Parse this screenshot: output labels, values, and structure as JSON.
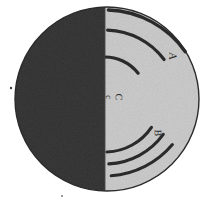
{
  "figure": {
    "type": "scanned-halftone-diagram",
    "caption": "",
    "background_color": "#ffffff"
  },
  "sphere": {
    "center_x": 107,
    "center_y": 99,
    "radius": 92,
    "outline_color": "#2b2b2b",
    "outline_width": 1.4,
    "dark_half": {
      "name": "shadowed-hemisphere",
      "side": "left",
      "fill_color": "#3a3a3a",
      "noise": "heavy"
    },
    "light_half": {
      "name": "illuminated-hemisphere",
      "side": "right",
      "fill_color": "#cdcdcd",
      "noise": "light"
    },
    "terminator": {
      "name": "terminator-line",
      "x": 105,
      "color": "#4a4a4a"
    }
  },
  "labels": [
    {
      "id": "A",
      "text": "A",
      "x": 172,
      "y": 56,
      "rotation": 92,
      "color": "#262626",
      "size": 11
    },
    {
      "id": "C",
      "text": "C",
      "x": 118,
      "y": 97,
      "rotation": 92,
      "color": "#262626",
      "size": 10
    },
    {
      "id": "C2",
      "text": "c",
      "x": 108,
      "y": 97,
      "rotation": 92,
      "color": "#262626",
      "size": 9
    },
    {
      "id": "B",
      "text": "B",
      "x": 157,
      "y": 133,
      "rotation": 92,
      "color": "#262626",
      "size": 10
    }
  ],
  "arc_groups": [
    {
      "name": "arc-group-a",
      "label_ref": "A",
      "count": 2,
      "stroke_color": "#2a2a2a",
      "arcs": [
        {
          "cx": 105,
          "cy": 108,
          "r": 98,
          "start_deg": 272,
          "end_deg": 325,
          "width": 3.4
        },
        {
          "cx": 105,
          "cy": 104,
          "r": 74,
          "start_deg": 272,
          "end_deg": 323,
          "width": 3.2
        }
      ]
    },
    {
      "name": "arc-group-c",
      "label_ref": "C",
      "count": 1,
      "stroke_color": "#2a2a2a",
      "arcs": [
        {
          "cx": 105,
          "cy": 99,
          "r": 42,
          "start_deg": 268,
          "end_deg": 322,
          "width": 3.2
        }
      ]
    },
    {
      "name": "arc-group-b",
      "label_ref": "B",
      "count": 3,
      "stroke_color": "#2a2a2a",
      "arcs": [
        {
          "cx": 105,
          "cy": 96,
          "r": 56,
          "start_deg": 34,
          "end_deg": 88,
          "width": 3.1
        },
        {
          "cx": 105,
          "cy": 92,
          "r": 72,
          "start_deg": 36,
          "end_deg": 87,
          "width": 3.1
        },
        {
          "cx": 105,
          "cy": 88,
          "r": 88,
          "start_deg": 40,
          "end_deg": 86,
          "width": 3.0
        }
      ]
    }
  ],
  "specks": [
    {
      "name": "speck-left-margin",
      "x": 11,
      "y": 88,
      "r": 1.2,
      "color": "#3d3d3d"
    },
    {
      "name": "speck-lower-margin",
      "x": 62,
      "y": 196,
      "r": 0.9,
      "color": "#6a6a6a"
    }
  ]
}
